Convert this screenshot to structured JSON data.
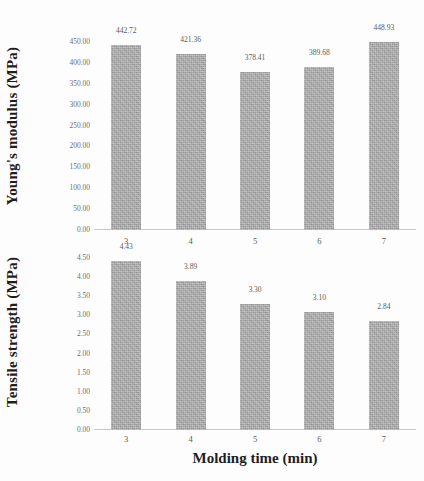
{
  "chart_data": [
    {
      "type": "bar",
      "title": "",
      "xlabel": "Molding time (min)",
      "ylabel": "Young's modulus (MPa)",
      "categories": [
        "3",
        "4",
        "5",
        "6",
        "7"
      ],
      "values": [
        442.72,
        421.36,
        378.41,
        389.68,
        448.93
      ],
      "data_labels": [
        "442.72",
        "421.36",
        "378.41",
        "389.68",
        "448.93"
      ],
      "ylim": [
        0,
        450
      ],
      "yticks": [
        450.0,
        400.0,
        350.0,
        300.0,
        250.0,
        200.0,
        150.0,
        100.0,
        50.0,
        0.0
      ],
      "ytick_labels": [
        "450.00",
        "400.00",
        "350.00",
        "300.00",
        "250.00",
        "200.00",
        "150.00",
        "100.00",
        "50.00",
        "0.00"
      ],
      "grid": false,
      "legend": "none",
      "bar_color": "#a6a6a6"
    },
    {
      "type": "bar",
      "title": "",
      "xlabel": "Molding time (min)",
      "ylabel": "Tensile strength (MPa)",
      "categories": [
        "3",
        "4",
        "5",
        "6",
        "7"
      ],
      "values": [
        4.43,
        3.89,
        3.3,
        3.1,
        2.84
      ],
      "data_labels": [
        "4.43",
        "3.89",
        "3.30",
        "3.10",
        "2.84"
      ],
      "ylim": [
        0,
        4.5
      ],
      "yticks": [
        4.5,
        4.0,
        3.5,
        3.0,
        2.5,
        2.0,
        1.5,
        1.0,
        0.5,
        0.0
      ],
      "ytick_labels": [
        "4.50",
        "4.00",
        "3.50",
        "3.00",
        "2.50",
        "2.00",
        "1.50",
        "1.00",
        "0.50",
        "0.00"
      ],
      "grid": false,
      "legend": "none",
      "bar_color": "#a6a6a6"
    }
  ],
  "figure": {
    "xaxis_title": "Molding time (min)",
    "panels": [
      {
        "ylabel": "Young's modulus (MPa)"
      },
      {
        "ylabel": "Tensile strength (MPa)"
      }
    ]
  }
}
